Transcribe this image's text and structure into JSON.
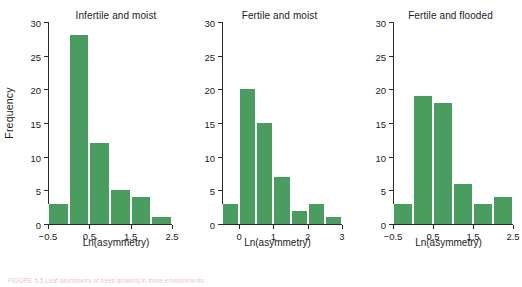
{
  "figure": {
    "caption": "FIGURE 5.5  Leaf asymmetry of trees growing in three environments.",
    "caption_label": "FIGURE 5.5",
    "y_axis_label": "Frequency"
  },
  "chart_data": [
    {
      "type": "bar",
      "title": "Infertile and moist",
      "xlabel": "Ln(asymmetry)",
      "ylabel": "Frequency",
      "ylim": [
        0,
        30
      ],
      "yticks": [
        0,
        5,
        10,
        15,
        20,
        25,
        30
      ],
      "ytick_labels": [
        "0",
        "5",
        "10",
        "15",
        "20",
        "25",
        "30"
      ],
      "xlim": [
        -0.5,
        2.5
      ],
      "xticks": [
        -0.5,
        0.5,
        1.5,
        2.5
      ],
      "xtick_labels": [
        "−0.5",
        "0.5",
        "1.5",
        "2.5"
      ],
      "bin_width": 0.5,
      "bin_edges": [
        -0.5,
        0.0,
        0.5,
        1.0,
        1.5,
        2.0,
        2.5
      ],
      "categories": [
        "-0.5 to 0.0",
        "0.0 to 0.5",
        "0.5 to 1.0",
        "1.0 to 1.5",
        "1.5 to 2.0",
        "2.0 to 2.5"
      ],
      "values": [
        3,
        28,
        12,
        5,
        4,
        1
      ],
      "grid": false,
      "legend": false,
      "bar_color": "#4a9d5e"
    },
    {
      "type": "bar",
      "title": "Fertile and moist",
      "xlabel": "Ln(asymmetry)",
      "ylabel": "Frequency",
      "ylim": [
        0,
        30
      ],
      "yticks": [
        0,
        5,
        10,
        15,
        20,
        25,
        30
      ],
      "ytick_labels": [
        "0",
        "5",
        "10",
        "15",
        "20",
        "25",
        "30"
      ],
      "xlim": [
        -0.5,
        3.0
      ],
      "xticks": [
        0,
        1,
        2,
        3
      ],
      "xtick_labels": [
        "0",
        "1",
        "2",
        "3"
      ],
      "bin_width": 0.5,
      "bin_edges": [
        -0.5,
        0.0,
        0.5,
        1.0,
        1.5,
        2.0,
        2.5,
        3.0
      ],
      "categories": [
        "-0.5 to 0.0",
        "0.0 to 0.5",
        "0.5 to 1.0",
        "1.0 to 1.5",
        "1.5 to 2.0",
        "2.0 to 2.5",
        "2.5 to 3.0"
      ],
      "values": [
        3,
        20,
        15,
        7,
        2,
        3,
        1
      ],
      "grid": false,
      "legend": false,
      "bar_color": "#4a9d5e"
    },
    {
      "type": "bar",
      "title": "Fertile and flooded",
      "xlabel": "Ln(asymmetry)",
      "ylabel": "Frequency",
      "ylim": [
        0,
        30
      ],
      "yticks": [
        0,
        5,
        10,
        15,
        20,
        25,
        30
      ],
      "ytick_labels": [
        "0",
        "5",
        "10",
        "15",
        "20",
        "25",
        "30"
      ],
      "xlim": [
        -0.5,
        2.5
      ],
      "xticks": [
        -0.5,
        0.5,
        1.5,
        2.5
      ],
      "xtick_labels": [
        "−0.5",
        "0.5",
        "1.5",
        "2.5"
      ],
      "bin_width": 0.5,
      "bin_edges": [
        -0.5,
        0.0,
        0.5,
        1.0,
        1.5,
        2.0,
        2.5
      ],
      "categories": [
        "-0.5 to 0.0",
        "0.0 to 0.5",
        "0.5 to 1.0",
        "1.0 to 1.5",
        "1.5 to 2.0",
        "2.0 to 2.5"
      ],
      "values": [
        3,
        19,
        18,
        6,
        3,
        4
      ],
      "grid": false,
      "legend": false,
      "bar_color": "#4a9d5e"
    }
  ]
}
